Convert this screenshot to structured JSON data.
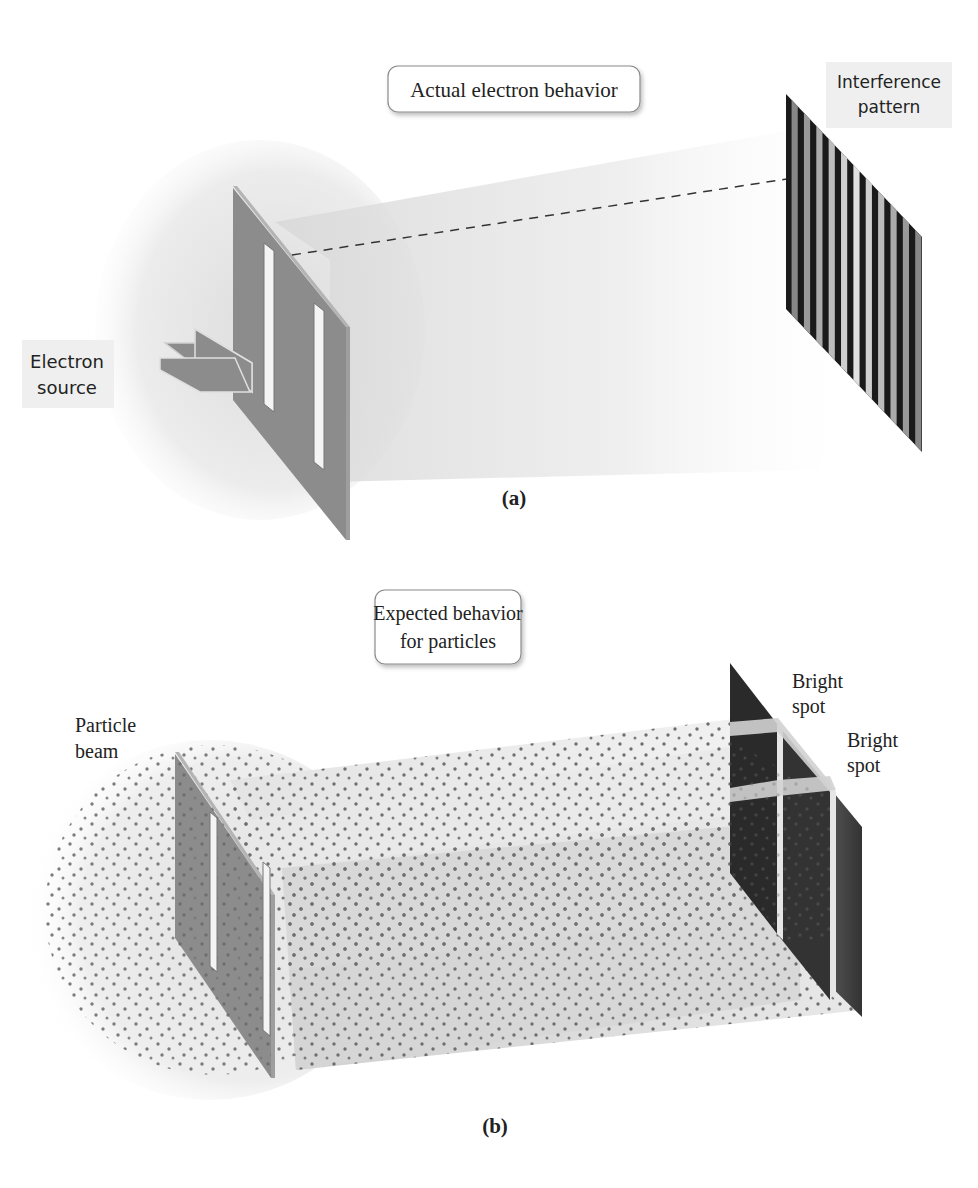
{
  "panel_a": {
    "caption": "(a)",
    "caption_letter": "a",
    "title": "Actual electron behavior",
    "source_label_line1": "Electron",
    "source_label_line2": "source",
    "screen_label_line1": "Interference",
    "screen_label_line2": "pattern",
    "screen_stripe_count": 11
  },
  "panel_b": {
    "caption": "(b)",
    "caption_letter": "b",
    "title_line1": "Expected behavior",
    "title_line2": "for particles",
    "source_label_line1": "Particle",
    "source_label_line2": "beam",
    "bright_spot_1_line1": "Bright",
    "bright_spot_1_line2": "spot",
    "bright_spot_2_line1": "Bright",
    "bright_spot_2_line2": "spot"
  },
  "colors": {
    "barrier": "#8c8c8c",
    "barrier_edge": "#b4b4b4",
    "beam": "#e4e4e4",
    "screen_dark": "#2a2a2a",
    "dot": "#6e6e6e",
    "label_bg": "#efefef"
  }
}
